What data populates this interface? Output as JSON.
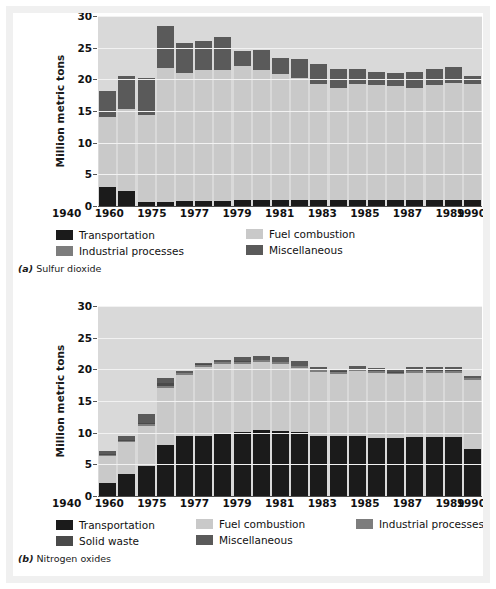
{
  "figure": {
    "background": "#ffffff",
    "frame_color": "#f0f0f0"
  },
  "colors": {
    "transportation": "#1b1b1b",
    "fuel_combustion": "#c9c9c9",
    "industrial_processes": "#7d7d7d",
    "solid_waste": "#4a4a4a",
    "miscellaneous": "#5a5a5a",
    "plot_background": "#d9d9d9",
    "gridline": "#f2f2f2",
    "axis": "#4d4d4d"
  },
  "panels": [
    {
      "id": "a",
      "caption_marker": "(a)",
      "caption_text": "Sulfur dioxide",
      "legend_rows": [
        [
          {
            "label": "Transportation",
            "color_key": "transportation",
            "name": "transportation"
          },
          {
            "label": "Fuel combustion",
            "color_key": "fuel_combustion",
            "name": "fuel-combustion"
          }
        ],
        [
          {
            "label": "Industrial processes",
            "color_key": "industrial_processes",
            "name": "industrial-processes"
          },
          {
            "label": "Miscellaneous",
            "color_key": "miscellaneous",
            "name": "miscellaneous"
          }
        ]
      ],
      "legend_col_offsets": [
        0,
        190
      ]
    },
    {
      "id": "b",
      "caption_marker": "(b)",
      "caption_text": "Nitrogen oxides",
      "legend_rows": [
        [
          {
            "label": "Transportation",
            "color_key": "transportation",
            "name": "transportation"
          },
          {
            "label": "Fuel combustion",
            "color_key": "fuel_combustion",
            "name": "fuel-combustion"
          },
          {
            "label": "Industrial processes",
            "color_key": "industrial_processes",
            "name": "industrial-processes"
          }
        ],
        [
          {
            "label": "Solid waste",
            "color_key": "solid_waste",
            "name": "solid-waste"
          },
          {
            "label": "Miscellaneous",
            "color_key": "miscellaneous",
            "name": "miscellaneous"
          }
        ]
      ],
      "legend_col_offsets": [
        0,
        140,
        300
      ]
    }
  ],
  "chart_data": [
    {
      "type": "bar",
      "stacked": true,
      "title": "Sulfur dioxide",
      "panel_label": "(a)",
      "xlabel": "",
      "ylabel": "Million metric tons",
      "ylim": [
        0,
        30
      ],
      "yticks": [
        0,
        5,
        10,
        15,
        20,
        25,
        30
      ],
      "grid": true,
      "legend_position": "below",
      "categories": [
        "1940",
        "1950",
        "1960",
        "1970",
        "1975",
        "1976",
        "1977",
        "1978",
        "1979",
        "1980",
        "1981",
        "1982",
        "1983",
        "1984",
        "1985",
        "1986",
        "1987",
        "1988",
        "1989",
        "1990"
      ],
      "tick_labels": [
        "1940",
        "",
        "1960",
        "",
        "1975",
        "",
        "1977",
        "",
        "1979",
        "",
        "1981",
        "",
        "1983",
        "",
        "1985",
        "",
        "1987",
        "",
        "1989",
        "1990"
      ],
      "series": [
        {
          "name": "Transportation",
          "color_key": "transportation",
          "values": [
            3.0,
            2.4,
            0.6,
            0.7,
            0.8,
            0.8,
            0.8,
            0.9,
            0.9,
            0.9,
            0.9,
            0.9,
            0.9,
            0.9,
            0.9,
            0.9,
            0.9,
            0.9,
            0.9,
            0.9
          ]
        },
        {
          "name": "Fuel combustion",
          "color_key": "fuel_combustion",
          "values": [
            11.0,
            12.9,
            13.8,
            21.1,
            20.2,
            20.7,
            20.7,
            21.2,
            20.6,
            19.9,
            19.3,
            18.3,
            17.7,
            18.3,
            18.2,
            18.0,
            17.8,
            18.2,
            18.6,
            18.4
          ]
        },
        {
          "name": "Industrial processes",
          "color_key": "industrial_processes",
          "values": [
            0,
            0,
            0,
            0,
            0,
            0,
            0,
            0,
            0,
            0,
            0,
            0,
            0,
            0,
            0,
            0,
            0,
            0,
            0,
            0
          ]
        },
        {
          "name": "Miscellaneous",
          "color_key": "miscellaneous",
          "values": [
            4.2,
            5.2,
            5.8,
            6.6,
            4.8,
            4.5,
            5.2,
            2.3,
            3.1,
            2.6,
            3.0,
            3.2,
            3.0,
            2.5,
            2.1,
            2.1,
            2.4,
            2.5,
            2.4,
            1.3
          ]
        }
      ],
      "totals": [
        18.2,
        20.5,
        20.2,
        28.4,
        25.8,
        26.0,
        26.7,
        24.4,
        24.6,
        23.4,
        23.2,
        22.4,
        21.6,
        21.7,
        21.2,
        21.0,
        21.1,
        21.6,
        21.9,
        20.6
      ]
    },
    {
      "type": "bar",
      "stacked": true,
      "title": "Nitrogen oxides",
      "panel_label": "(b)",
      "xlabel": "",
      "ylabel": "Million metric tons",
      "ylim": [
        0,
        30
      ],
      "yticks": [
        0,
        5,
        10,
        15,
        20,
        25,
        30
      ],
      "grid": true,
      "legend_position": "below",
      "categories": [
        "1940",
        "1950",
        "1960",
        "1970",
        "1975",
        "1976",
        "1977",
        "1978",
        "1979",
        "1980",
        "1981",
        "1982",
        "1983",
        "1984",
        "1985",
        "1986",
        "1987",
        "1988",
        "1989",
        "1990"
      ],
      "tick_labels": [
        "1940",
        "",
        "1960",
        "",
        "1975",
        "",
        "1977",
        "",
        "1979",
        "",
        "1981",
        "",
        "1983",
        "",
        "1985",
        "",
        "1987",
        "",
        "1989",
        "1990"
      ],
      "series": [
        {
          "name": "Transportation",
          "color_key": "transportation",
          "values": [
            2.1,
            3.4,
            4.8,
            8.0,
            9.5,
            9.5,
            9.9,
            10.1,
            10.5,
            10.3,
            10.1,
            9.5,
            9.5,
            9.5,
            9.2,
            9.2,
            9.3,
            9.3,
            9.3,
            7.5
          ]
        },
        {
          "name": "Fuel combustion",
          "color_key": "fuel_combustion",
          "values": [
            4.2,
            5.1,
            6.3,
            9.0,
            9.6,
            10.9,
            10.9,
            10.8,
            10.6,
            10.5,
            10.1,
            10.1,
            9.8,
            10.2,
            10.3,
            10.0,
            10.1,
            10.2,
            10.2,
            10.8
          ]
        },
        {
          "name": "Industrial processes",
          "color_key": "industrial_processes",
          "values": [
            0.2,
            0.2,
            0.3,
            0.4,
            0.3,
            0.3,
            0.3,
            0.3,
            0.3,
            0.3,
            0.3,
            0.3,
            0.3,
            0.3,
            0.3,
            0.3,
            0.3,
            0.3,
            0.3,
            0.3
          ]
        },
        {
          "name": "Solid waste",
          "color_key": "solid_waste",
          "values": [
            0.1,
            0.1,
            0.2,
            0.4,
            0.1,
            0.1,
            0.1,
            0.1,
            0.1,
            0.1,
            0.1,
            0.1,
            0.1,
            0.1,
            0.1,
            0.1,
            0.1,
            0.1,
            0.1,
            0.1
          ]
        },
        {
          "name": "Miscellaneous",
          "color_key": "miscellaneous",
          "values": [
            0.5,
            0.7,
            1.4,
            0.9,
            0.2,
            0.2,
            0.3,
            0.6,
            0.6,
            0.7,
            0.7,
            0.4,
            0.3,
            0.4,
            0.3,
            0.5,
            0.5,
            0.4,
            0.4,
            0.3
          ]
        }
      ],
      "totals": [
        7.1,
        9.5,
        13.0,
        18.7,
        19.7,
        21.0,
        21.5,
        21.9,
        22.1,
        21.9,
        21.3,
        20.4,
        20.0,
        20.5,
        20.2,
        20.1,
        20.3,
        20.3,
        20.3,
        19.0
      ]
    }
  ]
}
